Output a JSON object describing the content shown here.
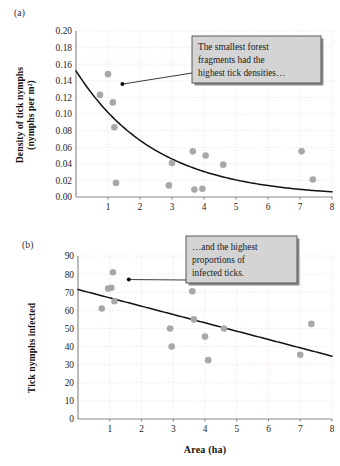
{
  "figure": {
    "panel_a_label": "(a)",
    "panel_b_label": "(b)"
  },
  "chart_data": [
    {
      "type": "scatter",
      "panel": "(a)",
      "title": "",
      "xlabel": "",
      "ylabel": "Density of tick nymphs (nymphs per m²)",
      "ylabel_line1": "Density of tick nymphs",
      "ylabel_line2": "(nymphs per m²)",
      "xlim": [
        0,
        8
      ],
      "ylim": [
        0,
        0.2
      ],
      "xticks": [
        1,
        2,
        3,
        4,
        5,
        6,
        7,
        8
      ],
      "xtick_labels": [
        "1",
        "2",
        "3",
        "4",
        "5",
        "6",
        "7",
        "8"
      ],
      "yticks": [
        0.0,
        0.02,
        0.04,
        0.06,
        0.08,
        0.1,
        0.12,
        0.14,
        0.16,
        0.18,
        0.2
      ],
      "ytick_labels": [
        "0.00",
        "0.02",
        "0.04",
        "0.06",
        "0.08",
        "0.10",
        "0.12",
        "0.14",
        "0.16",
        "0.18",
        "0.20"
      ],
      "grid": true,
      "legend": "none",
      "marker_color": "#a8a8a8",
      "points": [
        {
          "x": 0.75,
          "y": 0.123
        },
        {
          "x": 1.0,
          "y": 0.148
        },
        {
          "x": 1.15,
          "y": 0.114
        },
        {
          "x": 1.2,
          "y": 0.084
        },
        {
          "x": 1.25,
          "y": 0.017
        },
        {
          "x": 2.9,
          "y": 0.014
        },
        {
          "x": 3.0,
          "y": 0.041
        },
        {
          "x": 3.65,
          "y": 0.055
        },
        {
          "x": 3.7,
          "y": 0.009
        },
        {
          "x": 3.95,
          "y": 0.01
        },
        {
          "x": 4.05,
          "y": 0.05
        },
        {
          "x": 4.6,
          "y": 0.039
        },
        {
          "x": 7.05,
          "y": 0.055
        },
        {
          "x": 7.4,
          "y": 0.021
        }
      ],
      "fit": {
        "kind": "exponential-decay",
        "equation": "y = 0.152 * exp(-0.40 * x)",
        "a": 0.152,
        "b": 0.4
      },
      "annotation": {
        "lines": [
          "The smallest forest",
          "fragments had the",
          "highest tick densities…"
        ],
        "anchor_x": 1.45,
        "anchor_y": 0.136
      }
    },
    {
      "type": "scatter",
      "panel": "(b)",
      "title": "",
      "xlabel": "Area (ha)",
      "ylabel": "Tick nymphs infected",
      "xlim": [
        0,
        8
      ],
      "ylim": [
        0,
        90
      ],
      "xticks": [
        1,
        2,
        3,
        4,
        5,
        6,
        7,
        8
      ],
      "xtick_labels": [
        "1",
        "2",
        "3",
        "4",
        "5",
        "6",
        "7",
        "8"
      ],
      "yticks": [
        0,
        10,
        20,
        30,
        40,
        50,
        60,
        70,
        80,
        90
      ],
      "ytick_labels": [
        "0",
        "10",
        "20",
        "30",
        "40",
        "50",
        "60",
        "70",
        "80",
        "90"
      ],
      "grid": true,
      "legend": "none",
      "marker_color": "#a8a8a8",
      "points": [
        {
          "x": 0.75,
          "y": 61
        },
        {
          "x": 0.95,
          "y": 72
        },
        {
          "x": 1.05,
          "y": 72.5
        },
        {
          "x": 1.1,
          "y": 81
        },
        {
          "x": 1.15,
          "y": 65
        },
        {
          "x": 2.9,
          "y": 50
        },
        {
          "x": 2.95,
          "y": 40
        },
        {
          "x": 3.6,
          "y": 70.5
        },
        {
          "x": 3.65,
          "y": 55
        },
        {
          "x": 4.0,
          "y": 45.5
        },
        {
          "x": 4.1,
          "y": 32.5
        },
        {
          "x": 4.6,
          "y": 50
        },
        {
          "x": 7.0,
          "y": 35.5
        },
        {
          "x": 7.35,
          "y": 52.5
        }
      ],
      "fit": {
        "kind": "linear",
        "equation": "y = 71.5 - 4.6 * x",
        "intercept": 71.5,
        "slope": -4.6
      },
      "annotation": {
        "lines": [
          "…and the highest",
          "proportions of",
          "infected ticks."
        ],
        "anchor_x": 1.6,
        "anchor_y": 77
      }
    }
  ]
}
